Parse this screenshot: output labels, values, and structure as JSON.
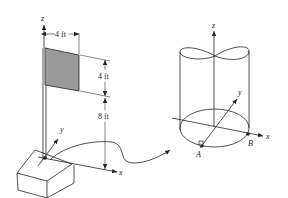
{
  "left_figure": {
    "axes": {
      "z": "z",
      "y": "y",
      "x": "x"
    },
    "dimensions": {
      "flag_width": "4 ft",
      "flag_height": "4 ft",
      "pole_height_below_flag": "8 ft"
    },
    "flag_color": "#9a9a9a"
  },
  "right_figure": {
    "axes": {
      "z": "z",
      "y": "y",
      "x": "x"
    },
    "points": {
      "a": "A",
      "b": "B"
    }
  }
}
